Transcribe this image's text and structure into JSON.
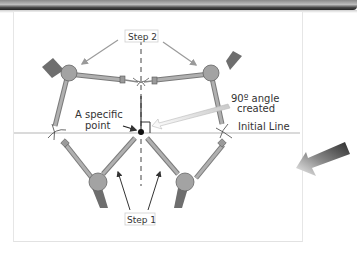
{
  "diagram": {
    "labels": {
      "step2": "Step 2",
      "step1": "Step 1",
      "specific_point_line1": "A specific",
      "specific_point_line2": "point",
      "angle_line1": "90º angle",
      "angle_line2": "created",
      "initial_line": "Initial Line"
    },
    "icons": {
      "compass": "compass-icon",
      "direction_arrow": "arrow-down-left-icon"
    },
    "colors": {
      "compass_head": "#a3a3a3",
      "compass_leg": "#8a8a8a",
      "pencil_tip": "#6e6e6e",
      "guide_line": "#999999",
      "label_border": "#cccccc",
      "arrow_dark": "#3a3a3a",
      "arrow_light": "#e8e8e8"
    }
  }
}
